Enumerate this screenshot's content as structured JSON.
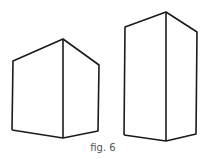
{
  "figure": {
    "caption": "fig. 6",
    "stroke_color": "#1a1a1a",
    "boxes": [
      {
        "name": "short-box",
        "top": [
          63,
          39
        ],
        "left_top": [
          13,
          61
        ],
        "right_top": [
          99,
          65
        ],
        "left_bottom": [
          12,
          130
        ],
        "bottom": [
          63,
          138
        ],
        "right_bottom": [
          98,
          131
        ]
      },
      {
        "name": "tall-box",
        "top": [
          166,
          12
        ],
        "left_top": [
          125,
          27
        ],
        "right_top": [
          197,
          32
        ],
        "left_bottom": [
          124,
          135
        ],
        "bottom": [
          166,
          141
        ],
        "right_bottom": [
          196,
          134
        ]
      }
    ]
  }
}
